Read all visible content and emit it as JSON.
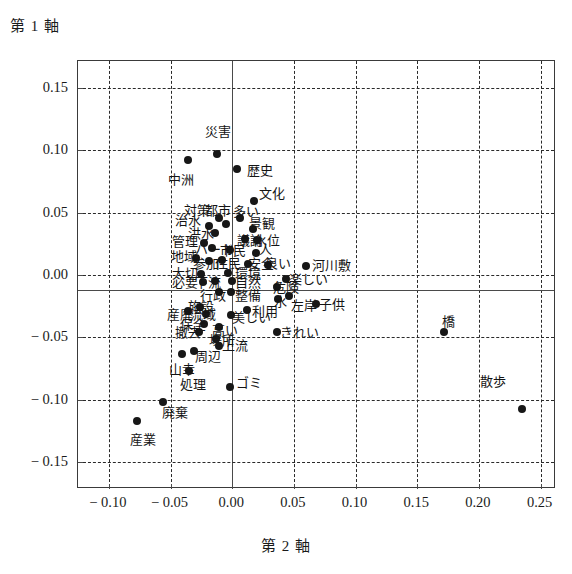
{
  "chart_data": {
    "type": "scatter",
    "title": "",
    "ylabel": "第 1 軸",
    "xlabel": "第 2 軸",
    "xlim": [
      -0.125,
      0.2625
    ],
    "ylim": [
      -0.1714,
      0.1714
    ],
    "xticks": [
      -0.1,
      -0.05,
      0.0,
      0.05,
      0.1,
      0.15,
      0.2,
      0.25
    ],
    "xtick_labels": [
      "− 0.10",
      "− 0.05",
      "0.00",
      "0.05",
      "0.10",
      "0.15",
      "0.20",
      "0.25"
    ],
    "yticks": [
      0.15,
      0.1,
      0.05,
      0.0,
      -0.05,
      -0.1,
      -0.15
    ],
    "ytick_labels": [
      "0.15",
      "0.10",
      "0.05",
      "0.00",
      "− 0.05",
      "− 0.10",
      "− 0.15"
    ],
    "grid": true,
    "grid_style": "dashed",
    "solid_axis_x": 0.0,
    "solid_axis_y": -0.012,
    "legend": "none",
    "points": [
      {
        "label": "災害",
        "x": -0.012,
        "y": 0.097,
        "lx": -0.022,
        "ly": 0.115,
        "anchor": "start"
      },
      {
        "label": "中洲",
        "x": -0.036,
        "y": 0.092,
        "lx": -0.052,
        "ly": 0.077,
        "anchor": "start"
      },
      {
        "label": "歴史",
        "x": 0.004,
        "y": 0.085,
        "lx": 0.012,
        "ly": 0.084,
        "anchor": "start"
      },
      {
        "label": "文化",
        "x": 0.018,
        "y": 0.059,
        "lx": 0.022,
        "ly": 0.066,
        "anchor": "start"
      },
      {
        "label": "対策",
        "x": -0.011,
        "y": 0.046,
        "lx": -0.039,
        "ly": 0.052,
        "anchor": "start"
      },
      {
        "label": "都市",
        "x": -0.005,
        "y": 0.041,
        "lx": -0.022,
        "ly": 0.052,
        "anchor": "start"
      },
      {
        "label": "多い",
        "x": 0.006,
        "y": 0.046,
        "lx": 0.001,
        "ly": 0.051,
        "anchor": "start"
      },
      {
        "label": "治水",
        "x": -0.019,
        "y": 0.039,
        "lx": -0.046,
        "ly": 0.044,
        "anchor": "start"
      },
      {
        "label": "洪水",
        "x": -0.014,
        "y": 0.034,
        "lx": -0.036,
        "ly": 0.034,
        "anchor": "start"
      },
      {
        "label": "景観",
        "x": 0.017,
        "y": 0.037,
        "lx": 0.014,
        "ly": 0.042,
        "anchor": "start"
      },
      {
        "label": "議論",
        "x": 0.01,
        "y": 0.029,
        "lx": 0.004,
        "ly": 0.028,
        "anchor": "start"
      },
      {
        "label": "水位",
        "x": 0.02,
        "y": 0.028,
        "lx": 0.018,
        "ly": 0.028,
        "anchor": "start"
      },
      {
        "label": "管理",
        "x": -0.023,
        "y": 0.026,
        "lx": -0.049,
        "ly": 0.027,
        "anchor": "start"
      },
      {
        "label": "ハード",
        "x": -0.016,
        "y": 0.022,
        "lx": -0.03,
        "ly": 0.021,
        "anchor": "start"
      },
      {
        "label": "市民",
        "x": -0.002,
        "y": 0.02,
        "lx": -0.01,
        "ly": 0.02,
        "anchor": "start"
      },
      {
        "label": "人",
        "x": 0.019,
        "y": 0.018,
        "lx": 0.022,
        "ly": 0.021,
        "anchor": "start"
      },
      {
        "label": "地域",
        "x": -0.029,
        "y": 0.014,
        "lx": -0.05,
        "ly": 0.015,
        "anchor": "start"
      },
      {
        "label": "参加",
        "x": -0.019,
        "y": 0.011,
        "lx": -0.032,
        "ly": 0.01,
        "anchor": "start"
      },
      {
        "label": "住民",
        "x": -0.008,
        "y": 0.012,
        "lx": -0.014,
        "ly": 0.01,
        "anchor": "start"
      },
      {
        "label": "安全",
        "x": 0.013,
        "y": 0.009,
        "lx": 0.013,
        "ly": 0.01,
        "anchor": "start"
      },
      {
        "label": "良い",
        "x": 0.029,
        "y": 0.008,
        "lx": 0.027,
        "ly": 0.01,
        "anchor": "start"
      },
      {
        "label": "大切",
        "x": -0.025,
        "y": 0.001,
        "lx": -0.049,
        "ly": 0.002,
        "anchor": "start"
      },
      {
        "label": "環境",
        "x": -0.003,
        "y": 0.002,
        "lx": 0.002,
        "ly": 0.002,
        "anchor": "start"
      },
      {
        "label": "河川敷",
        "x": 0.06,
        "y": 0.007,
        "lx": 0.065,
        "ly": 0.008,
        "anchor": "start"
      },
      {
        "label": "必要",
        "x": -0.024,
        "y": -0.006,
        "lx": -0.049,
        "ly": -0.006,
        "anchor": "start"
      },
      {
        "label": "下流",
        "x": -0.014,
        "y": -0.005,
        "lx": -0.03,
        "ly": -0.006,
        "anchor": "start"
      },
      {
        "label": "自然",
        "x": 0.0,
        "y": -0.005,
        "lx": 0.002,
        "ly": -0.006,
        "anchor": "start"
      },
      {
        "label": "楽しい",
        "x": 0.044,
        "y": -0.003,
        "lx": 0.046,
        "ly": -0.003,
        "anchor": "start"
      },
      {
        "label": "危険",
        "x": 0.036,
        "y": -0.01,
        "lx": 0.033,
        "ly": -0.01,
        "anchor": "start"
      },
      {
        "label": "行政",
        "x": -0.011,
        "y": -0.014,
        "lx": -0.026,
        "ly": -0.016,
        "anchor": "start"
      },
      {
        "label": "整備",
        "x": -0.001,
        "y": -0.014,
        "lx": 0.002,
        "ly": -0.016,
        "anchor": "start"
      },
      {
        "label": "水",
        "x": 0.037,
        "y": -0.019,
        "lx": 0.034,
        "ly": -0.021,
        "anchor": "start"
      },
      {
        "label": "左岸",
        "x": 0.046,
        "y": -0.017,
        "lx": 0.048,
        "ly": -0.024,
        "anchor": "start"
      },
      {
        "label": "子供",
        "x": 0.068,
        "y": -0.023,
        "lx": 0.07,
        "ly": -0.023,
        "anchor": "start"
      },
      {
        "label": "産廃",
        "x": -0.036,
        "y": -0.029,
        "lx": -0.053,
        "ly": -0.031,
        "anchor": "start"
      },
      {
        "label": "施設",
        "x": -0.026,
        "y": -0.026,
        "lx": -0.036,
        "ly": -0.025,
        "anchor": "start"
      },
      {
        "label": "流域",
        "x": -0.021,
        "y": -0.031,
        "lx": -0.034,
        "ly": -0.031,
        "anchor": "start"
      },
      {
        "label": "利用",
        "x": 0.012,
        "y": -0.028,
        "lx": 0.016,
        "ly": -0.029,
        "anchor": "start"
      },
      {
        "label": "美しい",
        "x": -0.001,
        "y": -0.032,
        "lx": 0.0,
        "ly": -0.034,
        "anchor": "start"
      },
      {
        "label": "保全",
        "x": -0.023,
        "y": -0.039,
        "lx": -0.042,
        "ly": -0.039,
        "anchor": "start"
      },
      {
        "label": "高い",
        "x": -0.011,
        "y": -0.042,
        "lx": -0.016,
        "ly": -0.044,
        "anchor": "start"
      },
      {
        "label": "撤去",
        "x": -0.027,
        "y": -0.046,
        "lx": -0.046,
        "ly": -0.046,
        "anchor": "start"
      },
      {
        "label": "きれい",
        "x": 0.036,
        "y": -0.046,
        "lx": 0.039,
        "ly": -0.046,
        "anchor": "start"
      },
      {
        "label": "橋",
        "x": 0.172,
        "y": -0.046,
        "lx": 0.17,
        "ly": -0.037,
        "anchor": "start"
      },
      {
        "label": "場所",
        "x": -0.013,
        "y": -0.051,
        "lx": -0.019,
        "ly": -0.052,
        "anchor": "start"
      },
      {
        "label": "上流",
        "x": -0.011,
        "y": -0.057,
        "lx": -0.008,
        "ly": -0.056,
        "anchor": "start"
      },
      {
        "label": "周辺",
        "x": -0.031,
        "y": -0.061,
        "lx": -0.03,
        "ly": -0.065,
        "anchor": "start"
      },
      {
        "label": "山幸",
        "x": -0.041,
        "y": -0.063,
        "lx": -0.051,
        "ly": -0.075,
        "anchor": "start"
      },
      {
        "label": "処理",
        "x": -0.035,
        "y": -0.077,
        "lx": -0.042,
        "ly": -0.087,
        "anchor": "start"
      },
      {
        "label": "ゴミ",
        "x": -0.002,
        "y": -0.09,
        "lx": 0.003,
        "ly": -0.086,
        "anchor": "start"
      },
      {
        "label": "散歩",
        "x": 0.235,
        "y": -0.107,
        "lx": 0.201,
        "ly": -0.085,
        "anchor": "start"
      },
      {
        "label": "廃棄",
        "x": -0.056,
        "y": -0.102,
        "lx": -0.057,
        "ly": -0.11,
        "anchor": "start"
      },
      {
        "label": "産業",
        "x": -0.077,
        "y": -0.117,
        "lx": -0.083,
        "ly": -0.131,
        "anchor": "start"
      }
    ]
  }
}
